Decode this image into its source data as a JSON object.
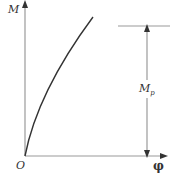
{
  "diagram": {
    "y_axis_label": "M",
    "x_axis_label": "φ",
    "origin_label": "O",
    "dimension_label_main": "M",
    "dimension_label_sub": "p",
    "colors": {
      "axis": "#9a9a9a",
      "curve": "#333333",
      "text": "#333333"
    }
  }
}
